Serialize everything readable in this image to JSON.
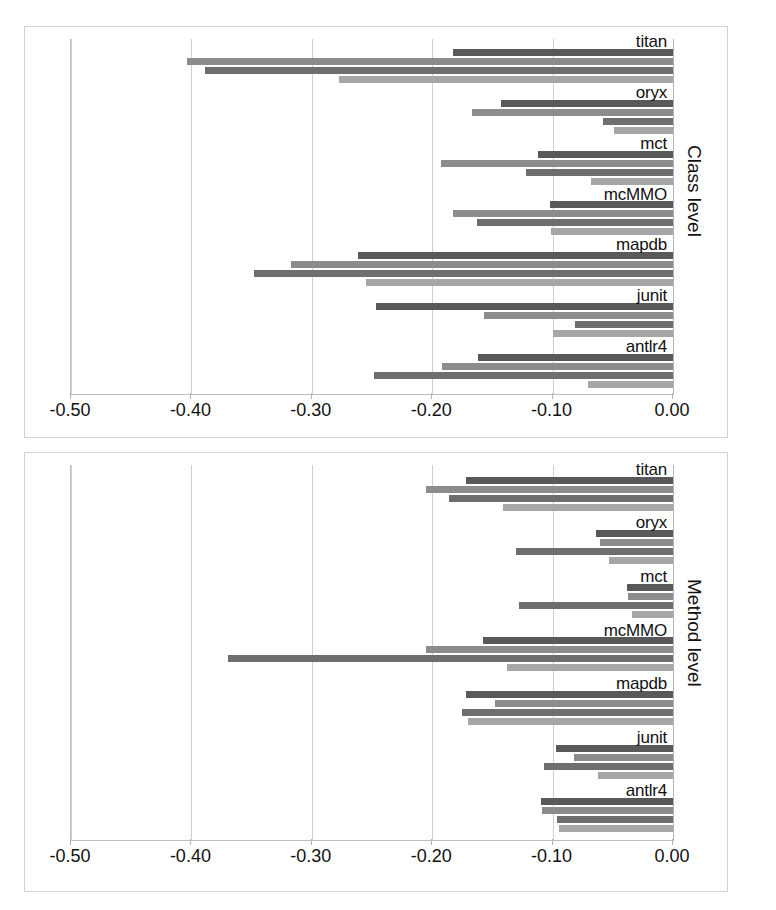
{
  "figure": {
    "background": "#ffffff",
    "panels": [
      "Class level",
      "Method level"
    ]
  },
  "colors": {
    "series1": "#595959",
    "series2": "#8c8c8c",
    "series3": "#6e6e6e",
    "series4": "#a6a6a6",
    "gridline": "#cfcfcf",
    "axis": "#b5b5b5",
    "text": "#111111"
  },
  "chart_data": [
    {
      "type": "bar",
      "orientation": "horizontal",
      "title": "",
      "ylabel": "Class level",
      "xlabel": "",
      "xlim": [
        -0.5,
        0.0
      ],
      "xticks": [
        "-0.50",
        "-0.40",
        "-0.30",
        "-0.20",
        "-0.10",
        "0.00"
      ],
      "xtick_values": [
        -0.5,
        -0.4,
        -0.3,
        -0.2,
        -0.1,
        0.0
      ],
      "grid": true,
      "legend": "none",
      "categories": [
        "antlr4",
        "junit",
        "mapdb",
        "mcMMO",
        "mct",
        "oryx",
        "titan"
      ],
      "series": [
        {
          "name": "series1",
          "values": [
            -0.162,
            -0.247,
            -0.262,
            -0.102,
            -0.112,
            -0.143,
            -0.183
          ]
        },
        {
          "name": "series2",
          "values": [
            -0.192,
            -0.157,
            -0.317,
            -0.183,
            -0.193,
            -0.167,
            -0.404
          ]
        },
        {
          "name": "series3",
          "values": [
            -0.248,
            -0.081,
            -0.348,
            -0.163,
            -0.122,
            -0.058,
            -0.389
          ]
        },
        {
          "name": "series4",
          "values": [
            -0.071,
            -0.1,
            -0.255,
            -0.101,
            -0.068,
            -0.049,
            -0.277
          ]
        }
      ]
    },
    {
      "type": "bar",
      "orientation": "horizontal",
      "title": "",
      "ylabel": "Method level",
      "xlabel": "",
      "xlim": [
        -0.5,
        0.0
      ],
      "xticks": [
        "-0.50",
        "-0.40",
        "-0.30",
        "-0.20",
        "-0.10",
        "0.00"
      ],
      "xtick_values": [
        -0.5,
        -0.4,
        -0.3,
        -0.2,
        -0.1,
        0.0
      ],
      "grid": true,
      "legend": "none",
      "categories": [
        "antlr4",
        "junit",
        "mapdb",
        "mcMMO",
        "mct",
        "oryx",
        "titan"
      ],
      "series": [
        {
          "name": "series1",
          "values": [
            -0.11,
            -0.097,
            -0.172,
            -0.158,
            -0.038,
            -0.064,
            -0.172
          ]
        },
        {
          "name": "series2",
          "values": [
            -0.109,
            -0.082,
            -0.148,
            -0.205,
            -0.037,
            -0.061,
            -0.205
          ]
        },
        {
          "name": "series3",
          "values": [
            -0.096,
            -0.107,
            -0.175,
            -0.37,
            -0.128,
            -0.13,
            -0.186
          ]
        },
        {
          "name": "series4",
          "values": [
            -0.095,
            -0.062,
            -0.17,
            -0.138,
            -0.034,
            -0.053,
            -0.141
          ]
        }
      ]
    }
  ]
}
